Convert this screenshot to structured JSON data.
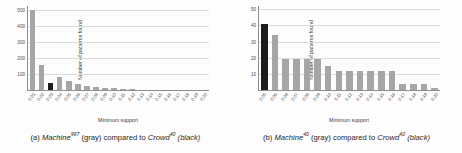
{
  "figure": {
    "panels": [
      {
        "id": "a",
        "caption_prefix": "(a)",
        "caption_series_gray": "Machine",
        "caption_gray_sup": "997",
        "caption_gray_tail": "(gray) compared to",
        "caption_series_black": "Crowd",
        "caption_black_sup": "40",
        "caption_black_tail": "(black)",
        "caption_full": "(a) Machine997 (gray) compared to Crowd40 (black)"
      },
      {
        "id": "b",
        "caption_prefix": "(b)",
        "caption_series_gray": "Machine",
        "caption_gray_sup": "40",
        "caption_gray_tail": "(gray) compared to",
        "caption_series_black": "Crowd",
        "caption_black_sup": "40",
        "caption_black_tail": "(black)",
        "caption_full": "(b) Machine40 (gray) compared to Crowd40 (black)"
      }
    ],
    "colors": {
      "gray_bar": "#a6a6a6",
      "black_bar": "#1c1c1c",
      "gridline": "#dcdcdc",
      "axis": "#8e8e8e",
      "background": "#fdfdfd"
    }
  },
  "chart_data": [
    {
      "type": "bar",
      "title": "(a) Machine997 (gray) compared to Crowd40 (black)",
      "xlabel": "Minimum support",
      "ylabel": "Number of patterns found",
      "ylim": [
        0,
        520
      ],
      "yticks": [
        100,
        200,
        300,
        400,
        500
      ],
      "ytick_labels": [
        "100",
        "200",
        "300",
        "400",
        "500"
      ],
      "grid": true,
      "legend": null,
      "categories": [
        "0.01",
        "0.02",
        "0.03",
        "0.04",
        "0.05",
        "0.06",
        "0.07",
        "0.08",
        "0.09",
        "0.10",
        "0.11",
        "0.12",
        "0.13",
        "0.14",
        "0.15",
        "0.16",
        "0.17",
        "0.18",
        "0.19",
        "0.20"
      ],
      "values": [
        495,
        152,
        41,
        78,
        55,
        38,
        25,
        18,
        14,
        11,
        6,
        4,
        3,
        2,
        2,
        1,
        1,
        1,
        1,
        1
      ],
      "bar_colors": [
        "gray",
        "gray",
        "black",
        "gray",
        "gray",
        "gray",
        "gray",
        "gray",
        "gray",
        "gray",
        "gray",
        "gray",
        "gray",
        "gray",
        "gray",
        "gray",
        "gray",
        "gray",
        "gray",
        "gray"
      ],
      "highlight_index": 2,
      "highlight_label": "0.03"
    },
    {
      "type": "bar",
      "title": "(b) Machine40 (gray) compared to Crowd40 (black)",
      "xlabel": "Minimum support",
      "ylabel": "Number of patterns found",
      "ylim": [
        0,
        52
      ],
      "yticks": [
        10,
        20,
        30,
        40,
        50
      ],
      "ytick_labels": [
        "10",
        "20",
        "30",
        "40",
        "50"
      ],
      "grid": true,
      "legend": null,
      "categories": [
        "0.05",
        "0.06",
        "0.08",
        "0.07",
        "0.08",
        "0.09",
        "0.10",
        "0.11",
        "0.12",
        "0.13",
        "0.14",
        "0.15",
        "0.16",
        "0.17",
        "0.18",
        "0.19",
        "0.20"
      ],
      "values": [
        41,
        34,
        19,
        19,
        19,
        19,
        15,
        12,
        12,
        12,
        12,
        12,
        12,
        4,
        4,
        4,
        1
      ],
      "bar_colors": [
        "black",
        "gray",
        "gray",
        "gray",
        "gray",
        "gray",
        "gray",
        "gray",
        "gray",
        "gray",
        "gray",
        "gray",
        "gray",
        "gray",
        "gray",
        "gray",
        "gray"
      ],
      "highlight_index": 0,
      "highlight_label": "0.05"
    }
  ]
}
